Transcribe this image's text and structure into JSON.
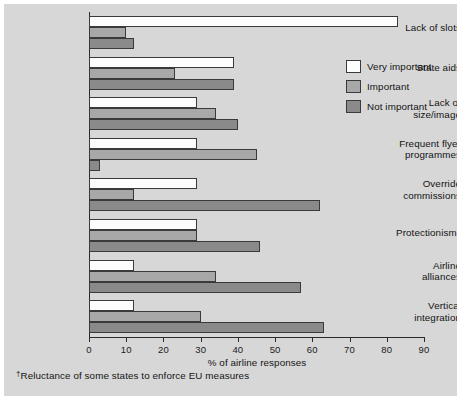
{
  "chart_data": {
    "type": "bar",
    "orientation": "horizontal",
    "title": "",
    "xlabel": "% of airline responses",
    "ylabel": "",
    "xlim": [
      0,
      90
    ],
    "xticks": [
      0,
      10,
      20,
      30,
      40,
      50,
      60,
      70,
      80,
      90
    ],
    "grid": false,
    "legend_position": "top-right",
    "categories": [
      "Lack of slots",
      "State aids",
      "Lack of\nsize/image",
      "Frequent flyer\nprogrammes",
      "Override\ncommissions",
      "Protectionism†",
      "Airline\nalliances",
      "Vertical\nintegration"
    ],
    "series": [
      {
        "name": "Very important",
        "color": "#fdfdfd",
        "values": [
          83,
          39,
          29,
          29,
          29,
          29,
          12,
          12
        ]
      },
      {
        "name": "Important",
        "color": "#a8a8a8",
        "values": [
          10,
          23,
          34,
          45,
          12,
          29,
          34,
          30
        ]
      },
      {
        "name": "Not important",
        "color": "#8a8a8a",
        "values": [
          12,
          39,
          40,
          3,
          62,
          46,
          57,
          63
        ]
      }
    ],
    "footnote": "Reluctance of some states to enforce EU measures",
    "footnote_marker": "†"
  },
  "axis": {
    "x_title": "% of airline responses",
    "ticks": [
      "0",
      "10",
      "20",
      "30",
      "40",
      "50",
      "60",
      "70",
      "80",
      "90"
    ]
  },
  "legend": {
    "items": [
      {
        "label": "Very important",
        "swatch": "very"
      },
      {
        "label": "Important",
        "swatch": "imp"
      },
      {
        "label": "Not important",
        "swatch": "notimp"
      }
    ]
  },
  "categories": [
    {
      "line1": "Lack of slots",
      "line2": ""
    },
    {
      "line1": "State aids",
      "line2": ""
    },
    {
      "line1": "Lack of",
      "line2": "size/image"
    },
    {
      "line1": "Frequent flyer",
      "line2": "programmes"
    },
    {
      "line1": "Override",
      "line2": "commissions"
    },
    {
      "line1": "Protectionism",
      "line2": "",
      "marker": "†"
    },
    {
      "line1": "Airline",
      "line2": "alliances"
    },
    {
      "line1": "Vertical",
      "line2": "integration"
    }
  ],
  "footnote": {
    "marker": "†",
    "text": "Reluctance of some states to enforce EU measures"
  }
}
